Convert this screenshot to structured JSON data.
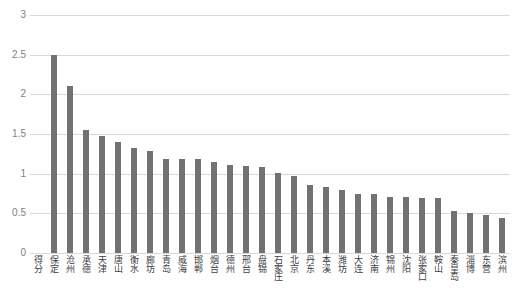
{
  "chart_data": {
    "type": "bar",
    "title": "",
    "xlabel": "",
    "ylabel": "",
    "ylim": [
      0,
      3
    ],
    "ytick_labels": [
      "3",
      "2.5",
      "2",
      "1.5",
      "1",
      "0.5",
      "0"
    ],
    "ytick_values": [
      3,
      2.5,
      2,
      1.5,
      1,
      0.5,
      0
    ],
    "grid": true,
    "legend": "none",
    "series_name": "得分",
    "bar_color": "#767171",
    "grid_color": "#d9d9d9",
    "axis_text_color": "#7f7f7f",
    "label_text_color": "#404040",
    "categories": [
      "得分",
      "保定",
      "沧州",
      "承德",
      "天津",
      "唐山",
      "衡水",
      "廊坊",
      "青岛",
      "威海",
      "邯郸",
      "烟台",
      "德州",
      "邢台",
      "盘锦",
      "石家庄",
      "北京",
      "丹东",
      "本溪",
      "潍坊",
      "大连",
      "济南",
      "锦州",
      "沈阳",
      "张家口",
      "鞍山",
      "秦皇岛",
      "淄博",
      "东营",
      "滨州"
    ],
    "values": [
      null,
      2.5,
      2.1,
      1.55,
      1.48,
      1.4,
      1.33,
      1.29,
      1.19,
      1.19,
      1.19,
      1.15,
      1.11,
      1.1,
      1.08,
      1.01,
      0.97,
      0.86,
      0.83,
      0.79,
      0.75,
      0.74,
      0.71,
      0.7,
      0.69,
      0.69,
      0.53,
      0.51,
      0.48,
      0.44
    ]
  }
}
